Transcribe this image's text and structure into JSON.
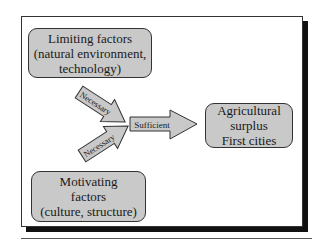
{
  "diagram": {
    "limiting_box": {
      "lines": [
        "Limiting factors",
        "(natural environment,",
        "technology)"
      ]
    },
    "motivating_box": {
      "lines": [
        "Motivating",
        "factors",
        "(culture, structure)"
      ]
    },
    "outcome_box": {
      "lines": [
        "Agricultural",
        "surplus",
        "First cities"
      ]
    },
    "arrows": {
      "top_label": "Necessary",
      "bottom_label": "Necessary",
      "main_label": "Sufficient"
    },
    "colors": {
      "box_fill": "#c9c9c9",
      "border": "#333333",
      "shadow": "#111111"
    }
  }
}
